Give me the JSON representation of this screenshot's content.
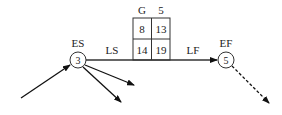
{
  "diagram": {
    "activity": {
      "name": "G",
      "duration": "5",
      "es": "8",
      "ef": "13",
      "ls": "14",
      "lf": "19"
    },
    "start_node": {
      "label": "ES",
      "number": "3"
    },
    "end_node": {
      "label": "EF",
      "number": "5"
    },
    "line_labels": {
      "left": "LS",
      "right": "LF"
    }
  }
}
